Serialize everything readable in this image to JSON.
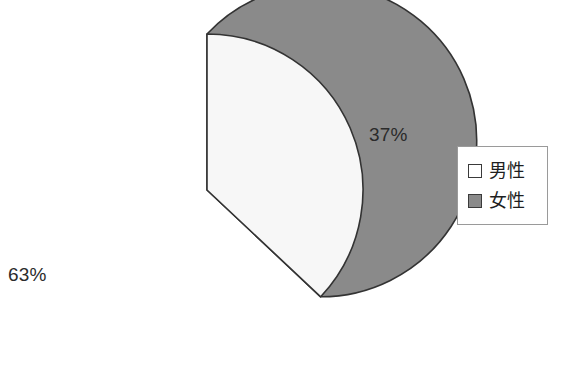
{
  "chart_data": {
    "type": "pie",
    "title": "",
    "categories": [
      "男性",
      "女性"
    ],
    "values": [
      37,
      63
    ],
    "value_labels": [
      "37%",
      "63%"
    ],
    "unit": "%",
    "legend_position": "right",
    "grid": false,
    "series": [
      {
        "name": "男性",
        "value": 37,
        "label": "37%",
        "color": "#f7f7f7",
        "stroke": "#333333",
        "start_angle_deg": 0,
        "end_angle_deg": 133.2
      },
      {
        "name": "女性",
        "value": 63,
        "label": "63%",
        "color": "#8a8a8a",
        "stroke": "#333333",
        "start_angle_deg": 133.2,
        "end_angle_deg": 360
      }
    ]
  },
  "chart": {
    "background": "#ffffff",
    "center_x": 207,
    "center_y": 190,
    "radius": 156,
    "male_label": "37%",
    "female_label": "63%"
  },
  "legend": {
    "border_color": "#9a9a9a",
    "items": [
      {
        "label": "男性",
        "color": "#ffffff"
      },
      {
        "label": "女性",
        "color": "#8a8a8a"
      }
    ]
  }
}
